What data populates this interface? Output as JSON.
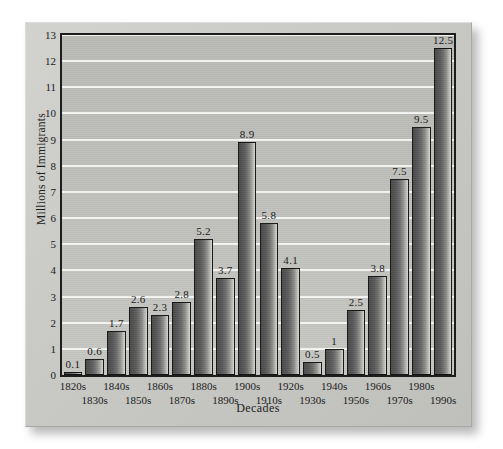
{
  "chart_data": {
    "type": "bar",
    "title": "",
    "xlabel": "Decades",
    "ylabel": "Millions of Immigrants",
    "ylim": [
      0,
      13
    ],
    "ytick_labels": [
      "0",
      "1",
      "2",
      "3",
      "4",
      "5",
      "6",
      "7",
      "8",
      "9",
      "10",
      "11",
      "12",
      "13"
    ],
    "grid": true,
    "legend": "none",
    "categories": [
      "1820s",
      "1830s",
      "1840s",
      "1850s",
      "1860s",
      "1870s",
      "1880s",
      "1890s",
      "1900s",
      "1910s",
      "1920s",
      "1930s",
      "1940s",
      "1950s",
      "1960s",
      "1970s",
      "1980s",
      "1990s"
    ],
    "values": [
      0.1,
      0.6,
      1.7,
      2.6,
      2.3,
      2.8,
      5.2,
      3.7,
      8.9,
      5.8,
      4.1,
      0.5,
      1,
      2.5,
      3.8,
      7.5,
      9.5,
      12.5
    ],
    "value_labels": [
      "0.1",
      "0.6",
      "1.7",
      "2.6",
      "2.3",
      "2.8",
      "5.2",
      "3.7",
      "8.9",
      "5.8",
      "4.1",
      "0.5",
      "1",
      "2.5",
      "3.8",
      "7.5",
      "9.5",
      "12.5"
    ]
  },
  "colors": {
    "bar_dark": "#4a4a4a",
    "bar_light": "#d6d6d2",
    "plot_background": "#bfbfbb",
    "gridline": "#f4f4f2",
    "panel_background": "#c8c8c4",
    "axis_line": "#1d1d1d",
    "text": "#1b1b1b"
  }
}
